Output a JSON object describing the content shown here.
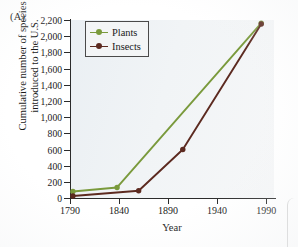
{
  "panel": {
    "label": "(A)"
  },
  "chart_data": {
    "type": "line",
    "title": "",
    "xlabel": "Year",
    "ylabel_lines": [
      "Cumulative number of species",
      "introduced to the U.S."
    ],
    "ylabel": "Cumulative number of species introduced to the U.S.",
    "xlim": [
      1790,
      1998
    ],
    "ylim": [
      0,
      2200
    ],
    "xticks": [
      1790,
      1840,
      1890,
      1940,
      1990
    ],
    "xtick_labels": [
      "1790",
      "1840",
      "1890",
      "1940",
      "1990"
    ],
    "yticks": [
      0,
      200,
      400,
      600,
      800,
      1000,
      1200,
      1400,
      1600,
      1800,
      2000,
      2200
    ],
    "ytick_labels": [
      "0",
      "200",
      "400",
      "600",
      "800",
      "1,000",
      "1,200",
      "1,400",
      "1,600",
      "1,800",
      "2,000",
      "2,200"
    ],
    "grid": false,
    "legend_position": "upper-left",
    "series": [
      {
        "name": "Plants",
        "color": "#7a9a3c",
        "marker": "circle",
        "x": [
          1793,
          1838,
          1985
        ],
        "y": [
          80,
          130,
          2160
        ]
      },
      {
        "name": "Insects",
        "color": "#5c2a20",
        "marker": "circle",
        "x": [
          1793,
          1860,
          1905,
          1985
        ],
        "y": [
          25,
          90,
          600,
          2150
        ]
      }
    ]
  },
  "legend": {
    "entries": [
      {
        "label": "Plants",
        "color": "#7a9a3c"
      },
      {
        "label": "Insects",
        "color": "#5c2a20"
      }
    ]
  },
  "colors": {
    "plants": "#7a9a3c",
    "insects": "#5c2a20",
    "plot_background": "#eef2f5",
    "axis": "#2b2b2b",
    "text": "#1a1a1a",
    "page_background": "#ffffff"
  }
}
